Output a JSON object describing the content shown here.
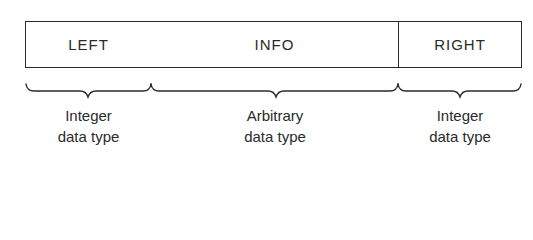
{
  "diagram": {
    "fields": [
      {
        "id": "left",
        "label": "LEFT"
      },
      {
        "id": "info",
        "label": "INFO"
      },
      {
        "id": "right",
        "label": "RIGHT"
      }
    ],
    "annotations": [
      {
        "for": "left",
        "line1": "Integer",
        "line2": "data type"
      },
      {
        "for": "info",
        "line1": "Arbitrary",
        "line2": "data type"
      },
      {
        "for": "right",
        "line1": "Integer",
        "line2": "data type"
      }
    ]
  }
}
